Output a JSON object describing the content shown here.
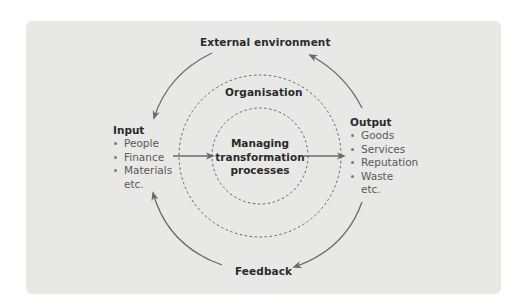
{
  "diagram": {
    "external_label": "External environment",
    "organisation_label": "Organisation",
    "feedback_label": "Feedback",
    "center_lines": [
      "Managing",
      "transformation",
      "processes"
    ],
    "input": {
      "title": "Input",
      "items": [
        "People",
        "Finance",
        "Materials"
      ],
      "etc": "etc."
    },
    "output": {
      "title": "Output",
      "items": [
        "Goods",
        "Services",
        "Reputation",
        "Waste"
      ],
      "etc": "etc."
    },
    "colors": {
      "panel": "#e8e8e6",
      "text": "#2b2b2b",
      "arrow": "#6a6a6a",
      "dashed": "#555555"
    }
  }
}
